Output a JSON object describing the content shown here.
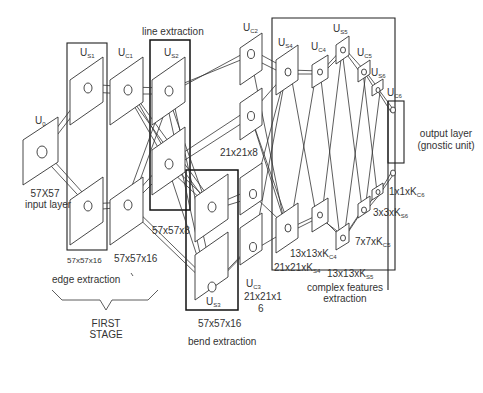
{
  "layers": {
    "u0": {
      "name": "U",
      "sub": "0",
      "size": "57X57",
      "desc": "input layer"
    },
    "us1": {
      "name": "U",
      "sub": "S1",
      "size": "57x57x16"
    },
    "uc1": {
      "name": "U",
      "sub": "C1",
      "size": "57x57x16"
    },
    "us2": {
      "name": "U",
      "sub": "S2",
      "size": "57x57x8"
    },
    "us3": {
      "name": "U",
      "sub": "S3",
      "size": "57x57x16"
    },
    "uc2": {
      "name": "U",
      "sub": "C2",
      "size": "21x21x8"
    },
    "uc3": {
      "name": "U",
      "sub": "C3",
      "size_line1": "21x21x1",
      "size_line2": "6"
    },
    "us4": {
      "name": "U",
      "sub": "S4",
      "size": "21x21xK",
      "size_sub": "S4"
    },
    "uc4": {
      "name": "U",
      "sub": "C4",
      "size": "13x13xK",
      "size_sub": "C4"
    },
    "us5": {
      "name": "U",
      "sub": "S5",
      "size": "13x13xK",
      "size_sub": "S5"
    },
    "uc5": {
      "name": "U",
      "sub": "C5",
      "size": "7x7xK",
      "size_sub": "C5"
    },
    "us6": {
      "name": "U",
      "sub": "S6",
      "size": "3x3xK",
      "size_sub": "S6"
    },
    "uc6": {
      "name": "U",
      "sub": "C6",
      "size": "1x1xK",
      "size_sub": "C6"
    }
  },
  "groups": {
    "edge": "edge extraction",
    "line": "line extraction",
    "bend": "bend extraction",
    "complex_line1": "complex features",
    "complex_line2": "extraction",
    "output_line1": "output layer",
    "output_line2": "(gnostic unit)",
    "first_stage_line1": "FIRST",
    "first_stage_line2": "STAGE"
  }
}
